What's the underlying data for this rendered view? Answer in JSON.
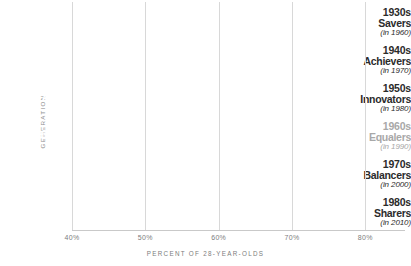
{
  "chart_data": {
    "type": "bar",
    "orientation": "horizontal",
    "title": "",
    "xlabel": "PERCENT OF 28-YEAR-OLDS",
    "ylabel": "GENERATION",
    "xlim": [
      40,
      85
    ],
    "xticks": [
      40,
      50,
      60,
      70,
      80
    ],
    "xtick_labels": [
      "40%",
      "50%",
      "60%",
      "70%",
      "80%"
    ],
    "grid": true,
    "legend": "none",
    "categories": [
      "1930s Savers (in 1960)",
      "1940s Achievers (in 1970)",
      "1950s Innovators (in 1980)",
      "1960s Equalers (in 1990)",
      "1970s Balancers (in 2000)",
      "1980s Sharers (in 2010)"
    ],
    "values": [
      85,
      84,
      73,
      64,
      60,
      49
    ],
    "value_labels": [
      "85%",
      "84%",
      "73%",
      "64%",
      "60%",
      "49%"
    ],
    "bar_colors": [
      "#1b1b1b",
      "#3b3b3b",
      "#3f3f3f",
      "#9a9a9a",
      "#3d3d3d",
      "#585858"
    ]
  },
  "bars": [
    {
      "decade": "1930s",
      "name": "Savers",
      "year": "(in 1960)",
      "value_label": "85%",
      "value": 85,
      "color": "#1b1b1b",
      "label_muted": false
    },
    {
      "decade": "1940s",
      "name": "Achievers",
      "year": "(in 1970)",
      "value_label": "84%",
      "value": 84,
      "color": "#3b3b3b",
      "label_muted": false
    },
    {
      "decade": "1950s",
      "name": "Innovators",
      "year": "(in 1980)",
      "value_label": "73%",
      "value": 73,
      "color": "#3f3f3f",
      "label_muted": false
    },
    {
      "decade": "1960s",
      "name": "Equalers",
      "year": "(in 1990)",
      "value_label": "64%",
      "value": 64,
      "color": "#9a9a9a",
      "label_muted": true
    },
    {
      "decade": "1970s",
      "name": "Balancers",
      "year": "(in 2000)",
      "value_label": "60%",
      "value": 60,
      "color": "#3d3d3d",
      "label_muted": false
    },
    {
      "decade": "1980s",
      "name": "Sharers",
      "year": "(in 2010)",
      "value_label": "49%",
      "value": 49,
      "color": "#585858",
      "label_muted": false
    }
  ],
  "axis": {
    "y_title": "GENERATION",
    "x_title": "PERCENT OF 28-YEAR-OLDS",
    "ticks": [
      "40%",
      "50%",
      "60%",
      "70%",
      "80%"
    ]
  },
  "colors": {
    "background": "#ffffff",
    "gridline": "#d8d8d8",
    "axis_line": "#c9c9c9",
    "tick_text": "#7d7d7d",
    "label_text": "#2b2b2b",
    "label_muted": "#a8a8a8",
    "value_text": "#ffffff"
  }
}
